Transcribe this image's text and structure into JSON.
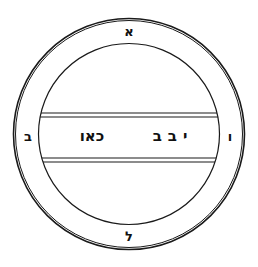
{
  "figure": {
    "colors": {
      "ink": "#1a1a1a",
      "background": "#ffffff"
    }
  },
  "ring_letters": {
    "top": "א",
    "left": "ב",
    "right": "ו",
    "bottom": "ל"
  },
  "band": {
    "left_text": "כאו",
    "right_text": "יבב"
  }
}
